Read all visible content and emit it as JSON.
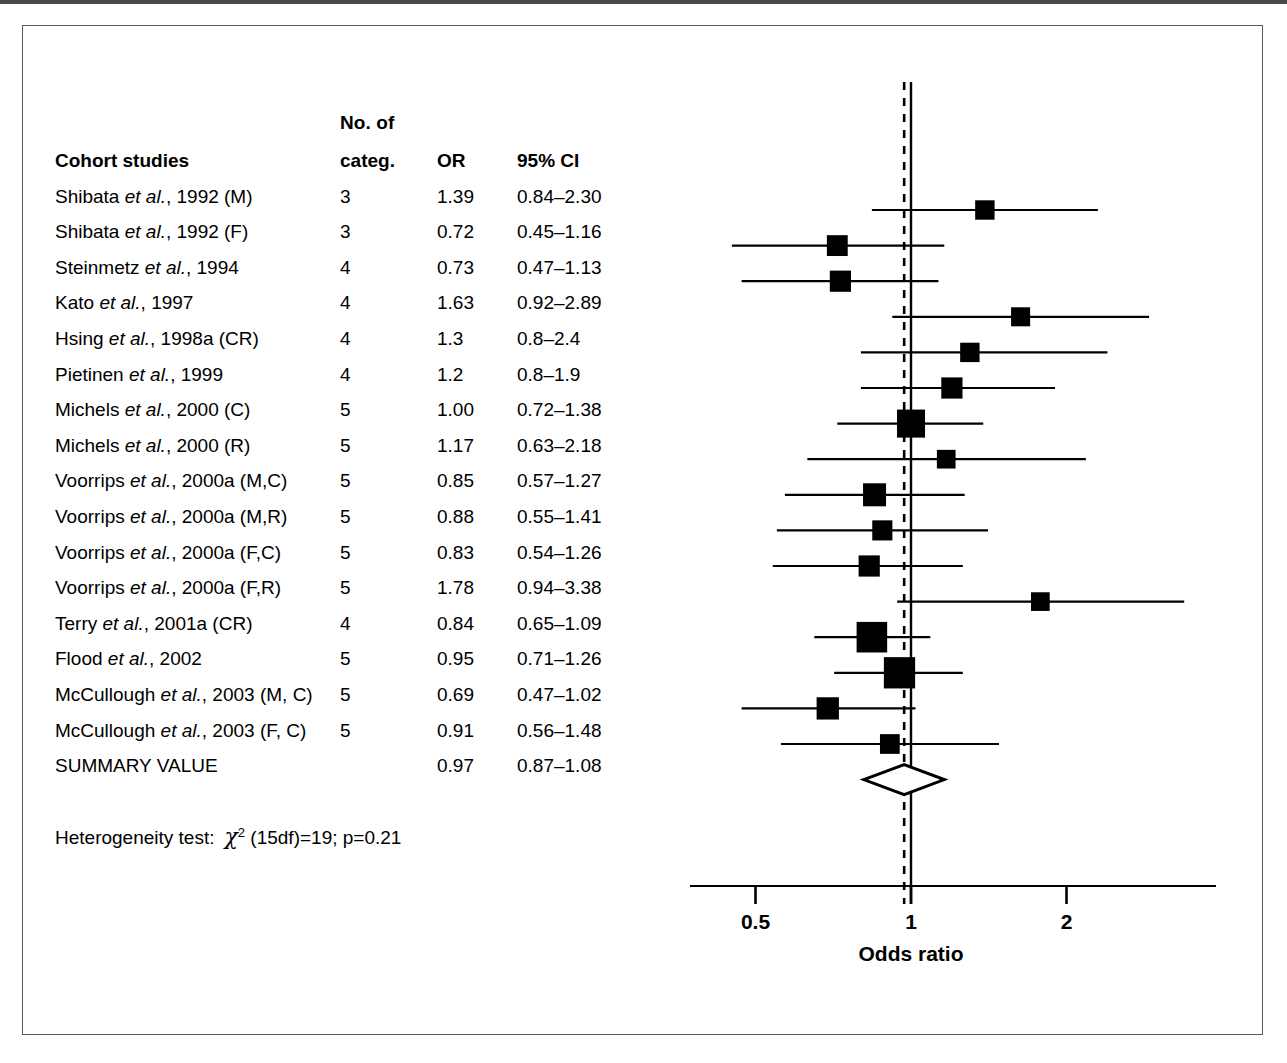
{
  "figure": {
    "axis_title": "Odds ratio",
    "heterogeneity": {
      "label": "Heterogeneity test:",
      "statistic_symbol": "χ",
      "statistic_exponent": "2",
      "detail": "(15df)=19; p=0.21"
    }
  },
  "table": {
    "header_top": "No. of",
    "headers": {
      "study": "Cohort studies",
      "categ": "categ.",
      "or": "OR",
      "ci": "95% CI"
    }
  },
  "chart_data": {
    "type": "forest",
    "title": "Cohort studies",
    "xlabel": "Odds ratio",
    "xscale": "log",
    "xlim": [
      0.4,
      3.6
    ],
    "xticks": [
      0.5,
      1,
      2
    ],
    "xtick_labels": [
      "0.5",
      "1",
      "2"
    ],
    "reference_line": 1,
    "summary_line": 0.97,
    "grid": false,
    "null_line_style": "solid",
    "summary_line_style": "dashed",
    "heterogeneity_test": "χ² (15df)=19; p=0.21",
    "heterogeneity_chi2": 19,
    "heterogeneity_df": 15,
    "heterogeneity_p": 0.21,
    "columns": [
      "Cohort studies",
      "No. of categ.",
      "OR",
      "95% CI"
    ],
    "rows": [
      {
        "study_prefix": "Shibata ",
        "study_italic": "et al.",
        "study_suffix": ", 1992 (M)",
        "study": "Shibata et al., 1992 (M)",
        "categ": "3",
        "or_text": "1.39",
        "ci_text": "0.84–2.30",
        "or": 1.39,
        "lcl": 0.84,
        "ucl": 2.3,
        "weight": 0.3,
        "summary": false
      },
      {
        "study_prefix": "Shibata ",
        "study_italic": "et al.",
        "study_suffix": ", 1992 (F)",
        "study": "Shibata et al., 1992 (F)",
        "categ": "3",
        "or_text": "0.72",
        "ci_text": "0.45–1.16",
        "or": 0.72,
        "lcl": 0.45,
        "ucl": 1.16,
        "weight": 0.38,
        "summary": false
      },
      {
        "study_prefix": "Steinmetz ",
        "study_italic": "et al.",
        "study_suffix": ", 1994",
        "study": "Steinmetz et al., 1994",
        "categ": "4",
        "or_text": "0.73",
        "ci_text": "0.47–1.13",
        "or": 0.73,
        "lcl": 0.47,
        "ucl": 1.13,
        "weight": 0.4,
        "summary": false
      },
      {
        "study_prefix": "Kato ",
        "study_italic": "et al.",
        "study_suffix": ", 1997",
        "study": "Kato et al., 1997",
        "categ": "4",
        "or_text": "1.63",
        "ci_text": "0.92–2.89",
        "or": 1.63,
        "lcl": 0.92,
        "ucl": 2.89,
        "weight": 0.28,
        "summary": false
      },
      {
        "study_prefix": "Hsing ",
        "study_italic": "et al.",
        "study_suffix": ", 1998a (CR)",
        "study": "Hsing et al., 1998a (CR)",
        "categ": "4",
        "or_text": "1.3",
        "ci_text": "0.8–2.4",
        "or": 1.3,
        "lcl": 0.8,
        "ucl": 2.4,
        "weight": 0.3,
        "summary": false
      },
      {
        "study_prefix": "Pietinen ",
        "study_italic": "et al.",
        "study_suffix": ", 1999",
        "study": "Pietinen et al., 1999",
        "categ": "4",
        "or_text": "1.2",
        "ci_text": "0.8–1.9",
        "or": 1.2,
        "lcl": 0.8,
        "ucl": 1.9,
        "weight": 0.4,
        "summary": false
      },
      {
        "study_prefix": "Michels ",
        "study_italic": "et al.",
        "study_suffix": ", 2000 (C)",
        "study": "Michels et al., 2000 (C)",
        "categ": "5",
        "or_text": "1.00",
        "ci_text": "0.72–1.38",
        "or": 1.0,
        "lcl": 0.72,
        "ucl": 1.38,
        "weight": 0.78,
        "summary": false
      },
      {
        "study_prefix": "Michels ",
        "study_italic": "et al.",
        "study_suffix": ", 2000 (R)",
        "study": "Michels et al., 2000 (R)",
        "categ": "5",
        "or_text": "1.17",
        "ci_text": "0.63–2.18",
        "or": 1.17,
        "lcl": 0.63,
        "ucl": 2.18,
        "weight": 0.26,
        "summary": false
      },
      {
        "study_prefix": "Voorrips ",
        "study_italic": "et al.",
        "study_suffix": ", 2000a (M,C)",
        "study": "Voorrips et al., 2000a (M,C)",
        "categ": "5",
        "or_text": "0.85",
        "ci_text": "0.57–1.27",
        "or": 0.85,
        "lcl": 0.57,
        "ucl": 1.27,
        "weight": 0.5,
        "summary": false
      },
      {
        "study_prefix": "Voorrips ",
        "study_italic": "et al.",
        "study_suffix": ", 2000a (M,R)",
        "study": "Voorrips et al., 2000a (M,R)",
        "categ": "5",
        "or_text": "0.88",
        "ci_text": "0.55–1.41",
        "or": 0.88,
        "lcl": 0.55,
        "ucl": 1.41,
        "weight": 0.34,
        "summary": false
      },
      {
        "study_prefix": "Voorrips ",
        "study_italic": "et al.",
        "study_suffix": ", 2000a (F,C)",
        "study": "Voorrips et al., 2000a (F,C)",
        "categ": "5",
        "or_text": "0.83",
        "ci_text": "0.54–1.26",
        "or": 0.83,
        "lcl": 0.54,
        "ucl": 1.26,
        "weight": 0.4,
        "summary": false
      },
      {
        "study_prefix": "Voorrips ",
        "study_italic": "et al.",
        "study_suffix": ", 2000a (F,R)",
        "study": "Voorrips et al., 2000a (F,R)",
        "categ": "5",
        "or_text": "1.78",
        "ci_text": "0.94–3.38",
        "or": 1.78,
        "lcl": 0.94,
        "ucl": 3.38,
        "weight": 0.26,
        "summary": false
      },
      {
        "study_prefix": "Terry ",
        "study_italic": "et al.",
        "study_suffix": ", 2001a (CR)",
        "study": "Terry et al., 2001a (CR)",
        "categ": "4",
        "or_text": "0.84",
        "ci_text": "0.65–1.09",
        "or": 0.84,
        "lcl": 0.65,
        "ucl": 1.09,
        "weight": 0.92,
        "summary": false
      },
      {
        "study_prefix": "Flood ",
        "study_italic": "et al.",
        "study_suffix": ", 2002",
        "study": "Flood et al., 2002",
        "categ": "5",
        "or_text": "0.95",
        "ci_text": "0.71–1.26",
        "or": 0.95,
        "lcl": 0.71,
        "ucl": 1.26,
        "weight": 0.96,
        "summary": false
      },
      {
        "study_prefix": "McCullough ",
        "study_italic": "et al.",
        "study_suffix": ", 2003 (M, C)",
        "study": "McCullough et al., 2003 (M, C)",
        "categ": "5",
        "or_text": "0.69",
        "ci_text": "0.47–1.02",
        "or": 0.69,
        "lcl": 0.47,
        "ucl": 1.02,
        "weight": 0.46,
        "summary": false
      },
      {
        "study_prefix": "McCullough ",
        "study_italic": "et al.",
        "study_suffix": ", 2003 (F, C)",
        "study": "McCullough et al., 2003 (F, C)",
        "categ": "5",
        "or_text": "0.91",
        "ci_text": "0.56–1.48",
        "or": 0.91,
        "lcl": 0.56,
        "ucl": 1.48,
        "weight": 0.32,
        "summary": false
      },
      {
        "study_prefix": "SUMMARY VALUE",
        "study_italic": "",
        "study_suffix": "",
        "study": "SUMMARY VALUE",
        "categ": "",
        "or_text": "0.97",
        "ci_text": "0.87–1.08",
        "or": 0.97,
        "lcl": 0.87,
        "ucl": 1.08,
        "weight": 0,
        "summary": true
      }
    ]
  }
}
